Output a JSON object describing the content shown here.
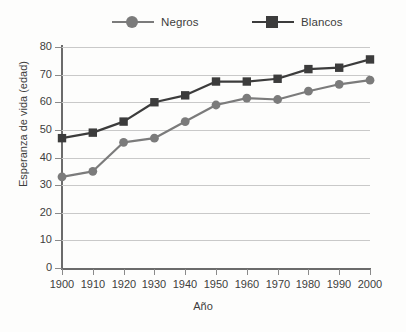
{
  "chart_data": {
    "type": "line",
    "title": "",
    "xlabel": "Año",
    "ylabel": "Esperanza de vida (edad)",
    "x": [
      1900,
      1910,
      1920,
      1930,
      1940,
      1950,
      1960,
      1970,
      1980,
      1990,
      2000
    ],
    "xtick_labels": [
      "1900",
      "1910",
      "1920",
      "1930",
      "1940",
      "1950",
      "1960",
      "1970",
      "1980",
      "1990",
      "2000"
    ],
    "ytick_labels": [
      "0",
      "10",
      "20",
      "30",
      "40",
      "50",
      "60",
      "70",
      "80"
    ],
    "yticks": [
      0,
      10,
      20,
      30,
      40,
      50,
      60,
      70,
      80
    ],
    "xlim": [
      1900,
      2000
    ],
    "ylim": [
      0,
      80
    ],
    "grid": true,
    "legend_position": "top",
    "series": [
      {
        "name": "Negros",
        "marker": "circle",
        "color": "#7b7b7b",
        "values": [
          33,
          35,
          45.5,
          47,
          53,
          59,
          61.5,
          61,
          64,
          66.5,
          68
        ]
      },
      {
        "name": "Blancos",
        "marker": "square",
        "color": "#3c3c3c",
        "values": [
          47,
          49,
          53,
          60,
          62.5,
          67.5,
          67.5,
          68.5,
          72,
          72.5,
          75.5
        ]
      }
    ]
  },
  "legend": {
    "entries": [
      {
        "label": "Negros"
      },
      {
        "label": "Blancos"
      }
    ]
  },
  "colors": {
    "negros": "#7b7b7b",
    "blancos": "#3c3c3c",
    "grid": "#c9c9c9",
    "axis": "#6b6b6b",
    "text": "#3d3d3d",
    "background": "#fdfdfc"
  }
}
